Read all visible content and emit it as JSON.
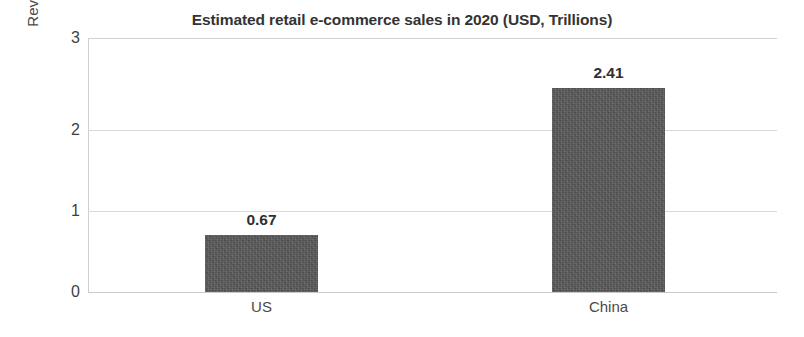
{
  "chart_data": {
    "type": "bar",
    "title": "Estimated retail e-commerce sales in 2020 (USD, Trillions)",
    "xlabel": "",
    "ylabel": "Revenue, USD, Trillions",
    "categories": [
      "US",
      "China"
    ],
    "values": [
      0.67,
      2.41
    ],
    "value_labels": [
      "0.67",
      "2.41"
    ],
    "ylim": [
      0,
      3
    ],
    "yticks": [
      0,
      1,
      2,
      3
    ],
    "ytick_labels": [
      "0",
      "1",
      "2",
      "3"
    ],
    "grid": "horizontal",
    "legend": "none",
    "series": [
      {
        "name": "Estimated retail e-commerce sales in 2020",
        "values": [
          0.67,
          2.41
        ],
        "color": "#585858"
      }
    ],
    "colors": {
      "bar": "#585858",
      "gridline": "#d8d8d8",
      "axis": "#cfcfcf",
      "title_text": "#333333",
      "tick_text": "#3f3f3f",
      "label_text": "#4a4a4a",
      "value_text": "#2f2f2f",
      "background": "#ffffff"
    }
  }
}
